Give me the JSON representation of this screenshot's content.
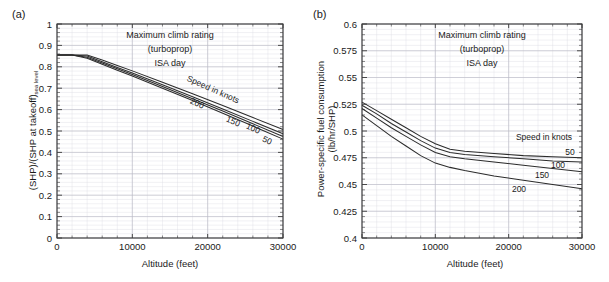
{
  "figure": {
    "panels": [
      {
        "tag": "(a)",
        "annotations": [
          "Maximum climb rating",
          "(turboprop)",
          "ISA day"
        ],
        "legend_title": "Speed in knots",
        "xlabel": "Altitude (feet)",
        "ylabel_main": "(SHP)/(SHP at takeoff)",
        "ylabel_sub": "sea level"
      },
      {
        "tag": "(b)",
        "annotations": [
          "Maximum climb rating",
          "(turboprop)",
          "ISA day"
        ],
        "legend_title": "Speed in knots",
        "xlabel": "Altitude (feet)",
        "ylabel_line1": "Power-specific fuel consumption",
        "ylabel_line2": "(lb/hr/SHP)"
      }
    ]
  },
  "chart_data": [
    {
      "type": "line",
      "panel": "(a)",
      "title": "Maximum climb rating (turboprop) ISA day",
      "xlabel": "Altitude (feet)",
      "ylabel": "(SHP)/(SHP at takeoff) sea level",
      "xlim": [
        0,
        30000
      ],
      "ylim": [
        0,
        1
      ],
      "xticks": [
        0,
        10000,
        20000,
        30000
      ],
      "xtick_labels": [
        "0",
        "10000",
        "20000",
        "30000"
      ],
      "yticks": [
        0,
        0.1,
        0.2,
        0.3,
        0.4,
        0.5,
        0.6,
        0.7,
        0.8,
        0.9,
        1
      ],
      "ytick_labels": [
        "0",
        "0.1",
        "0.2",
        "0.3",
        "0.4",
        "0.5",
        "0.6",
        "0.7",
        "0.8",
        "0.9",
        "1"
      ],
      "x_minor_step": 2000,
      "y_minor_step": 0.02,
      "grid": true,
      "legend_title": "Speed in knots",
      "legend_position": "inline-along-curves",
      "x": [
        0,
        2000,
        4000,
        6000,
        8000,
        10000,
        14000,
        18000,
        22000,
        26000,
        30000
      ],
      "series": [
        {
          "name": "50",
          "label": "50",
          "values": [
            0.855,
            0.855,
            0.84,
            0.812,
            0.784,
            0.757,
            0.7,
            0.642,
            0.583,
            0.523,
            0.462
          ]
        },
        {
          "name": "100",
          "label": "100",
          "values": [
            0.855,
            0.855,
            0.845,
            0.818,
            0.791,
            0.764,
            0.708,
            0.651,
            0.593,
            0.534,
            0.474
          ]
        },
        {
          "name": "150",
          "label": "150",
          "values": [
            0.855,
            0.855,
            0.85,
            0.824,
            0.797,
            0.771,
            0.716,
            0.66,
            0.603,
            0.545,
            0.487
          ]
        },
        {
          "name": "200",
          "label": "200",
          "values": [
            0.855,
            0.855,
            0.855,
            0.832,
            0.806,
            0.781,
            0.728,
            0.674,
            0.619,
            0.563,
            0.507
          ]
        }
      ]
    },
    {
      "type": "line",
      "panel": "(b)",
      "title": "Maximum climb rating (turboprop) ISA day",
      "xlabel": "Altitude (feet)",
      "ylabel": "Power-specific fuel consumption (lb/hr/SHP)",
      "xlim": [
        0,
        30000
      ],
      "ylim": [
        0.4,
        0.6
      ],
      "xticks": [
        0,
        10000,
        20000,
        30000
      ],
      "xtick_labels": [
        "0",
        "10000",
        "20000",
        "30000"
      ],
      "yticks": [
        0.4,
        0.425,
        0.45,
        0.475,
        0.5,
        0.525,
        0.55,
        0.575,
        0.6
      ],
      "ytick_labels": [
        "0.4",
        "0.425",
        "0.45",
        "0.475",
        "0.5",
        "0.525",
        "0.55",
        "0.575",
        "0.6"
      ],
      "x_minor_step": 2000,
      "y_minor_step": 0.005,
      "grid": true,
      "legend_title": "Speed in knots",
      "legend_position": "right-inline",
      "x": [
        0,
        2000,
        4000,
        6000,
        8000,
        10000,
        12000,
        14000,
        18000,
        22000,
        26000,
        30000
      ],
      "series": [
        {
          "name": "50",
          "label": "50",
          "values": [
            0.527,
            0.519,
            0.511,
            0.503,
            0.495,
            0.488,
            0.483,
            0.481,
            0.479,
            0.477,
            0.476,
            0.475
          ]
        },
        {
          "name": "100",
          "label": "100",
          "values": [
            0.524,
            0.516,
            0.507,
            0.499,
            0.491,
            0.484,
            0.48,
            0.478,
            0.476,
            0.474,
            0.472,
            0.471
          ]
        },
        {
          "name": "150",
          "label": "150",
          "values": [
            0.521,
            0.512,
            0.503,
            0.495,
            0.487,
            0.48,
            0.476,
            0.474,
            0.471,
            0.468,
            0.465,
            0.462
          ]
        },
        {
          "name": "200",
          "label": "200",
          "values": [
            0.515,
            0.505,
            0.495,
            0.486,
            0.477,
            0.47,
            0.466,
            0.463,
            0.458,
            0.454,
            0.45,
            0.446
          ]
        }
      ]
    }
  ]
}
